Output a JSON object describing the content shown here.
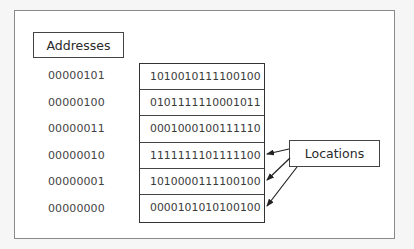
{
  "diagram": {
    "title_labels": {
      "addresses": "Addresses",
      "locations": "Locations"
    },
    "rows": [
      {
        "address": "00000101",
        "content": "1010010111100100"
      },
      {
        "address": "00000100",
        "content": "0101111110001011"
      },
      {
        "address": "00000011",
        "content": "0001000100111110"
      },
      {
        "address": "00000010",
        "content": "1111111101111100"
      },
      {
        "address": "00000001",
        "content": "1010000111100100"
      },
      {
        "address": "00000000",
        "content": "0000101010100100"
      }
    ],
    "arrows": {
      "from": "locations",
      "to_rows": [
        3,
        4,
        5
      ]
    },
    "colors": {
      "background": "#f6f6f6",
      "frame_border": "#8a8a8a",
      "box_border": "#333333",
      "text": "#3a3a3a"
    }
  }
}
